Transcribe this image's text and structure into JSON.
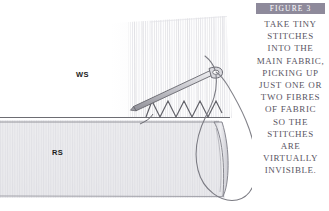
{
  "figure": {
    "header_label": "FIGURE 3",
    "caption_text": "TAKE TINY STITCHES INTO THE MAIN FABRIC, PICKING UP JUST ONE OR TWO FIBRES OF FABRIC SO THE STITCHES ARE VIRTUALLY INVISIBLE.",
    "caption_lines": [
      "TAKE TINY",
      "STITCHES",
      "INTO THE",
      "MAIN FABRIC,",
      "PICKING UP",
      "JUST ONE OR",
      "TWO FIBRES",
      "OF FABRIC",
      "SO THE",
      "STITCHES",
      "ARE",
      "VIRTUALLY",
      "INVISIBLE."
    ]
  },
  "illustration": {
    "upper_fabric_label": "WS",
    "lower_fabric_label": "RS",
    "elements": {
      "needle": "sewing-needle",
      "thread": "thread-loop",
      "stitches": "zigzag-slip-stitches",
      "fold_line": "fabric-fold-edge",
      "fabric_roll": "rolled-fabric-tube"
    }
  },
  "colors": {
    "header_bar": "#8e8a9b",
    "header_text": "#ffffff",
    "caption_text": "#595563",
    "label_text": "#1c1c1c",
    "upper_fabric": "#ffffff",
    "lower_fabric": "#e9e9ec",
    "line_ink": "#6d6d73",
    "needle_fill": "#cfcfd4",
    "page_background": "#ffffff"
  }
}
